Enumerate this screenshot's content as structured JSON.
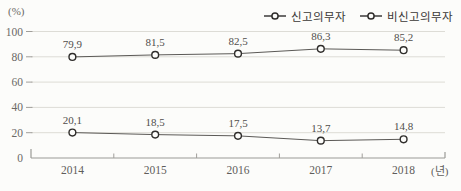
{
  "chart_data": {
    "type": "line",
    "title": "",
    "unit_label_y": "(%)",
    "unit_label_x": "(년)",
    "categories": [
      "2014",
      "2015",
      "2016",
      "2017",
      "2018"
    ],
    "series": [
      {
        "name": "신고의무자",
        "values": [
          79.9,
          81.5,
          82.5,
          86.3,
          85.2
        ],
        "labels": [
          "79,9",
          "81,5",
          "82,5",
          "86,3",
          "85,2"
        ]
      },
      {
        "name": "비신고의무자",
        "values": [
          20.1,
          18.5,
          17.5,
          13.7,
          14.8
        ],
        "labels": [
          "20,1",
          "18,5",
          "17,5",
          "13,7",
          "14,8"
        ]
      }
    ],
    "yticks": [
      0,
      20,
      40,
      60,
      80,
      100
    ],
    "ylim": [
      0,
      100
    ],
    "grid": true,
    "legend_position": "top-right",
    "marker": "open-circle",
    "colors": {
      "background": "#fcfcfa",
      "gridline": "#dddddd8",
      "axis": "#9a9a96",
      "line": "#5b5956",
      "marker_stroke": "#2f2d2b",
      "marker_fill": "#fcfcfa",
      "tick_text": "#6b6966",
      "label_text": "#504e4b",
      "legend_text": "#3a3836"
    }
  }
}
